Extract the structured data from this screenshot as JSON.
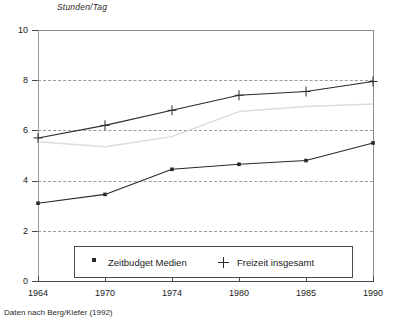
{
  "chart_data": {
    "type": "line",
    "title": "",
    "subtitle": "",
    "ylabel": "Stunden/Tag",
    "xlabel": "",
    "categories": [
      "1964",
      "1970",
      "1974",
      "1980",
      "1985",
      "1990"
    ],
    "x": [
      1964,
      1970,
      1974,
      1980,
      1985,
      1990
    ],
    "series": [
      {
        "name": "Freizeit insgesamt",
        "marker": "plus",
        "color": "#2a2a2a",
        "values": [
          5.7,
          6.2,
          6.8,
          7.4,
          7.55,
          7.95
        ]
      },
      {
        "name": "Zeitbudget Medien",
        "marker": "square",
        "color": "#2a2a2a",
        "values": [
          3.1,
          3.45,
          4.45,
          4.65,
          4.8,
          5.5
        ]
      }
    ],
    "ylim": [
      0,
      10
    ],
    "yticks": [
      0,
      2,
      4,
      6,
      8,
      10
    ],
    "ytick_labels": [
      "0",
      "2",
      "4",
      "6",
      "8",
      "10"
    ],
    "grid": true,
    "grid_style": "dashed-horizontal",
    "legend_position": "bottom-inside",
    "annotations": [
      "Daten nach Berg/Kiefer (1992)"
    ]
  },
  "axis": {
    "y_title": "Stunden/Tag",
    "y_ticks": [
      "10",
      "8",
      "6",
      "4",
      "2",
      "0"
    ],
    "x_ticks": [
      "1964",
      "1970",
      "1974",
      "1980",
      "1985",
      "1990"
    ]
  },
  "legend": {
    "items": [
      {
        "label": "Zeitbudget Medien",
        "marker": "square-marker"
      },
      {
        "label": "Freizeit insgesamt",
        "marker": "plus-marker"
      }
    ]
  },
  "footer": {
    "source_note": "Daten nach Berg/Kiefer (1992)"
  },
  "colors": {
    "line": "#2a2a2a",
    "grid": "#9a9a9a",
    "axis": "#4a4a4a",
    "background": "#ffffff",
    "faint_line": "#dcdcdc"
  }
}
